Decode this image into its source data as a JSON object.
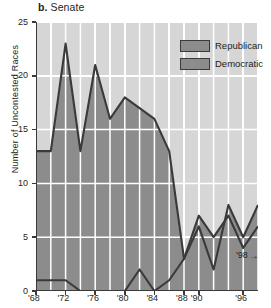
{
  "title": {
    "letter": "b.",
    "text": "Senate"
  },
  "legend": {
    "position": "top-right",
    "items": [
      {
        "label": "Republican",
        "color": "#8c8c8c"
      },
      {
        "label": "Democratic",
        "color": "#8c8c8c"
      }
    ]
  },
  "annotation": {
    "label": "'98",
    "arrow": "→"
  },
  "chart_data": {
    "type": "area",
    "title": "b. Senate",
    "xlabel": "",
    "ylabel": "Number of Uncontested Races",
    "xlim": [
      1968,
      1998
    ],
    "ylim": [
      0,
      25
    ],
    "grid": true,
    "legend_position": "top-right",
    "x": [
      1968,
      1970,
      1972,
      1974,
      1976,
      1978,
      1980,
      1982,
      1984,
      1986,
      1988,
      1990,
      1992,
      1994,
      1996,
      1998
    ],
    "xtick_values": [
      1968,
      1972,
      1976,
      1980,
      1984,
      1988,
      1990,
      1996
    ],
    "xtick_labels": [
      "'68",
      "'72",
      "'76",
      "'80",
      "'84",
      "'88",
      "'90",
      "'96"
    ],
    "ytick_values": [
      0,
      5,
      10,
      15,
      20,
      25
    ],
    "ytick_labels": [
      "0",
      "5",
      "10",
      "15",
      "20",
      "25"
    ],
    "series": [
      {
        "name": "Democratic",
        "values": [
          13,
          13,
          23,
          13,
          21,
          16,
          18,
          17,
          16,
          13,
          3,
          6,
          2,
          8,
          5,
          8
        ]
      },
      {
        "name": "Republican",
        "values": [
          1,
          1,
          1,
          0,
          0,
          0,
          0,
          2,
          0,
          1,
          3,
          7,
          5,
          7,
          4,
          6
        ]
      }
    ]
  }
}
